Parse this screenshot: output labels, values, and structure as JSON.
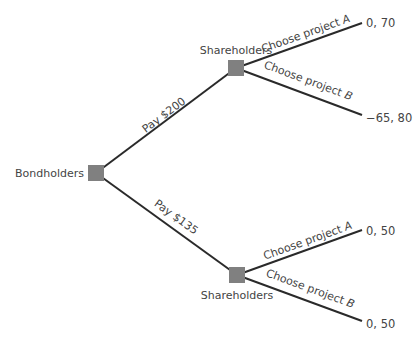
{
  "diagram": {
    "type": "game-tree",
    "colors": {
      "node": "#808080",
      "edge": "#2a2a2a",
      "text": "#444444"
    },
    "nodes": {
      "root": {
        "label": "Bondholders"
      },
      "upper": {
        "label": "Shareholders"
      },
      "lower": {
        "label": "Shareholders"
      }
    },
    "edges": {
      "pay200": {
        "label": "Pay $200"
      },
      "pay135": {
        "label": "Pay $135"
      },
      "upperA": {
        "label_prefix": "Choose project ",
        "label_var": "A"
      },
      "upperB": {
        "label_prefix": "Choose project ",
        "label_var": "B"
      },
      "lowerA": {
        "label_prefix": "Choose project ",
        "label_var": "A"
      },
      "lowerB": {
        "label_prefix": "Choose project ",
        "label_var": "B"
      }
    },
    "payoffs": {
      "upperA": "0, 70",
      "upperB": "−65, 80",
      "lowerA": "0, 50",
      "lowerB": "0, 50"
    }
  }
}
